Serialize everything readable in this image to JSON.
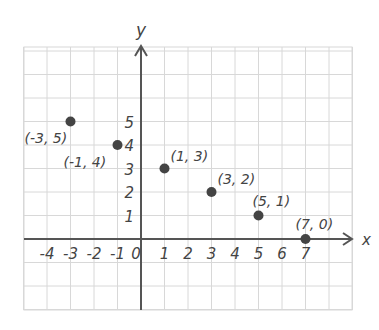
{
  "chart_data": {
    "type": "scatter",
    "title": "",
    "xlabel": "x",
    "ylabel": "y",
    "xlim": [
      -4.9,
      8.8
    ],
    "ylim": [
      -3,
      8
    ],
    "grid": true,
    "legend": null,
    "x_ticks": [
      "-4",
      "-3",
      "-2",
      "-1",
      "0",
      "1",
      "2",
      "3",
      "4",
      "5",
      "6",
      "7"
    ],
    "y_ticks": [
      "1",
      "2",
      "3",
      "4",
      "5"
    ],
    "series": [
      {
        "name": "points",
        "points": [
          {
            "x": -3,
            "y": 5,
            "label": "(-3, 5)"
          },
          {
            "x": -1,
            "y": 4,
            "label": "(-1, 4)"
          },
          {
            "x": 1,
            "y": 3,
            "label": "(1, 3)"
          },
          {
            "x": 3,
            "y": 2,
            "label": "(3, 2)"
          },
          {
            "x": 5,
            "y": 1,
            "label": "(5, 1)"
          },
          {
            "x": 7,
            "y": 0,
            "label": "(7, 0)"
          }
        ]
      }
    ]
  },
  "colors": {
    "grid": "#d8d8d8",
    "axis": "#555555",
    "point": "#444444",
    "text": "#444444"
  }
}
